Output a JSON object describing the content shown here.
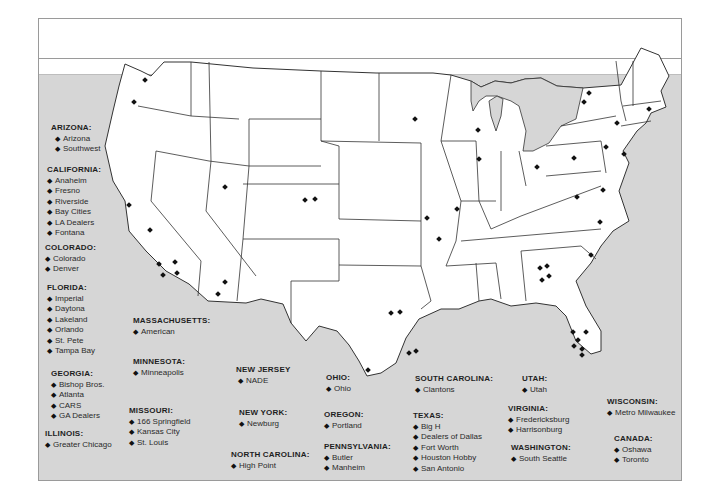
{
  "map": {
    "title": "",
    "marker_symbol": "diamond",
    "colors": {
      "land": "#ffffff",
      "water": "#d6d6d6",
      "border": "#333333",
      "marker": "#111111"
    }
  },
  "legend": [
    {
      "state": "ARIZONA:",
      "locations": [
        "Arizona",
        "Southwest"
      ]
    },
    {
      "state": "CALIFORNIA:",
      "locations": [
        "Anaheim",
        "Fresno",
        "Riverside",
        "Bay Cities",
        "LA Dealers",
        "Fontana"
      ]
    },
    {
      "state": "COLORADO:",
      "locations": [
        "Colorado",
        "Denver"
      ]
    },
    {
      "state": "FLORIDA:",
      "locations": [
        "Imperial",
        "Daytona",
        "Lakeland",
        "Orlando",
        "St. Pete",
        "Tampa Bay"
      ]
    },
    {
      "state": "GEORGIA:",
      "locations": [
        "Bishop Bros.",
        "Atlanta",
        "CARS",
        "GA Dealers"
      ]
    },
    {
      "state": "ILLINOIS:",
      "locations": [
        "Greater Chicago"
      ]
    },
    {
      "state": "MASSACHUSETTS:",
      "locations": [
        "American"
      ]
    },
    {
      "state": "MINNESOTA:",
      "locations": [
        "Minneapolis"
      ]
    },
    {
      "state": "MISSOURI:",
      "locations": [
        "166 Springfield",
        "Kansas City",
        "St. Louis"
      ]
    },
    {
      "state": "NEW JERSEY",
      "locations": [
        "NADE"
      ]
    },
    {
      "state": "NEW YORK:",
      "locations": [
        "Newburg"
      ]
    },
    {
      "state": "NORTH CAROLINA:",
      "locations": [
        "High Point"
      ]
    },
    {
      "state": "OHIO:",
      "locations": [
        "Ohio"
      ]
    },
    {
      "state": "OREGON:",
      "locations": [
        "Portland"
      ]
    },
    {
      "state": "PENNSYLVANIA:",
      "locations": [
        "Butler",
        "Manheim"
      ]
    },
    {
      "state": "SOUTH CAROLINA:",
      "locations": [
        "Clantons"
      ]
    },
    {
      "state": "TEXAS:",
      "locations": [
        "Big H",
        "Dealers of Dallas",
        "Fort Worth",
        "Houston Hobby",
        "San Antonio"
      ]
    },
    {
      "state": "UTAH:",
      "locations": [
        "Utah"
      ]
    },
    {
      "state": "VIRGINIA:",
      "locations": [
        "Fredericksburg",
        "Harrisonburg"
      ]
    },
    {
      "state": "WASHINGTON:",
      "locations": [
        "South Seattle"
      ]
    },
    {
      "state": "WISCONSIN:",
      "locations": [
        "Metro Milwaukee"
      ]
    },
    {
      "state": "CANADA:",
      "locations": [
        "Oshawa",
        "Toronto"
      ]
    }
  ]
}
